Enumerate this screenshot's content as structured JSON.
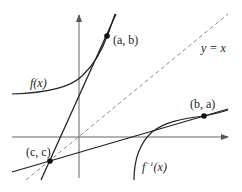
{
  "diagram": {
    "type": "function-inverse-tangent-lines",
    "labels": {
      "f": "f(x)",
      "finv_base": "f",
      "finv_sup": "−1",
      "finv_arg": "(x)",
      "point_ab": "(a, b)",
      "point_ba": "(b, a)",
      "point_cc": "(c, c)",
      "identity": "y = x"
    },
    "points": [
      {
        "name": "(a, b)",
        "x": 107,
        "y": 36
      },
      {
        "name": "(b, a)",
        "x": 204,
        "y": 116
      },
      {
        "name": "(c, c)",
        "x": 50,
        "y": 160
      }
    ],
    "colors": {
      "stroke": "#222222",
      "axis": "#666666",
      "dashed": "#888888"
    }
  }
}
